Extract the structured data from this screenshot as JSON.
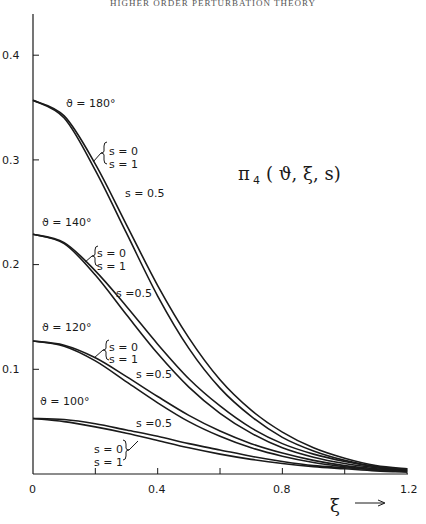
{
  "header": {
    "running_title": "HIGHER ORDER PERTURBATION THEORY"
  },
  "chart_data": {
    "type": "line",
    "xlabel": "ξ",
    "ylabel": "",
    "xlim": [
      0,
      1.2
    ],
    "ylim": [
      0,
      0.44
    ],
    "x_ticks": [
      "0",
      "0.4",
      "0.8",
      "1.2"
    ],
    "y_ticks": [
      "0.1",
      "0.2",
      "0.3",
      "0.4"
    ],
    "grid": false,
    "x": [
      0,
      0.1,
      0.2,
      0.3,
      0.4,
      0.5,
      0.6,
      0.7,
      0.8,
      0.9,
      1.0,
      1.1,
      1.2
    ],
    "series": [
      {
        "name": "ϑ = 180°, s = 0 / s = 1",
        "values": [
          0.357,
          0.34,
          0.29,
          0.23,
          0.17,
          0.12,
          0.082,
          0.055,
          0.035,
          0.022,
          0.013,
          0.007,
          0.004
        ]
      },
      {
        "name": "ϑ = 180°, s = 0.5",
        "values": [
          0.357,
          0.342,
          0.296,
          0.238,
          0.18,
          0.13,
          0.09,
          0.061,
          0.04,
          0.025,
          0.015,
          0.008,
          0.005
        ]
      },
      {
        "name": "ϑ = 140°, s = 0 / s = 1",
        "values": [
          0.229,
          0.22,
          0.19,
          0.152,
          0.115,
          0.083,
          0.058,
          0.039,
          0.025,
          0.016,
          0.01,
          0.006,
          0.003
        ]
      },
      {
        "name": "ϑ = 140°, s = 0.5",
        "values": [
          0.229,
          0.221,
          0.194,
          0.16,
          0.124,
          0.091,
          0.065,
          0.044,
          0.029,
          0.019,
          0.012,
          0.007,
          0.004
        ]
      },
      {
        "name": "ϑ = 120°, s = 0 / s = 1",
        "values": [
          0.127,
          0.122,
          0.108,
          0.088,
          0.068,
          0.05,
          0.036,
          0.025,
          0.017,
          0.011,
          0.007,
          0.004,
          0.003
        ]
      },
      {
        "name": "ϑ = 120°, s = 0.5",
        "values": [
          0.127,
          0.123,
          0.111,
          0.093,
          0.074,
          0.056,
          0.041,
          0.029,
          0.02,
          0.013,
          0.008,
          0.005,
          0.003
        ]
      },
      {
        "name": "ϑ = 100°, s = 0 / s = 1",
        "values": [
          0.053,
          0.05,
          0.045,
          0.039,
          0.032,
          0.025,
          0.019,
          0.014,
          0.01,
          0.007,
          0.005,
          0.003,
          0.002
        ]
      },
      {
        "name": "ϑ = 100°, s = 0.5",
        "values": [
          0.053,
          0.052,
          0.048,
          0.042,
          0.036,
          0.029,
          0.023,
          0.017,
          0.012,
          0.008,
          0.006,
          0.004,
          0.002
        ]
      }
    ],
    "annotations": [
      "ϑ = 180°",
      "ϑ = 140°",
      "ϑ = 120°",
      "ϑ = 100°",
      "s = 0",
      "s = 1",
      "s = 0.5"
    ]
  },
  "labels": {
    "theta180": "ϑ = 180°",
    "theta140": "ϑ = 140°",
    "theta120": "ϑ = 120°",
    "theta100": "ϑ = 100°",
    "s0": "s = 0",
    "s1": "s = 1",
    "s05": "s = 0.5",
    "s05b": "s =0.5",
    "func_pi": "π",
    "func_sub": "4",
    "func_args": "( ϑ, ξ, s)",
    "xaxis_symbol": "ξ",
    "xaxis_arrow": "⟶"
  }
}
